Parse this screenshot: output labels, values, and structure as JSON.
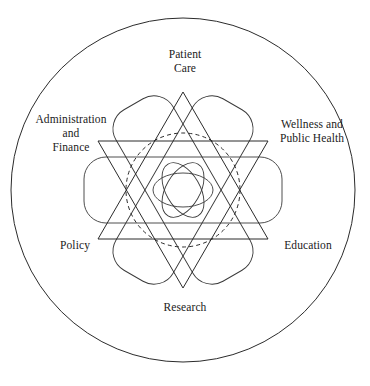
{
  "diagram": {
    "shape_summary": "Large outer circle enclosing a six-petal rosette made of three overlapping rounded capsules, a dashed inner circle, a hexagram of six straight chords, and a central rosette of three overlapping ellipses.",
    "colors": {
      "stroke": "#2b2b2b",
      "stroke_light": "#3a3a3a",
      "background": "#ffffff",
      "text": "#1a1a1a"
    },
    "labels": [
      {
        "id": "patient-care",
        "text": "Patient\nCare",
        "position": "top"
      },
      {
        "id": "wellness",
        "text": "Wellness and\nPublic Health",
        "position": "upper-right"
      },
      {
        "id": "education",
        "text": "Education",
        "position": "lower-right"
      },
      {
        "id": "research",
        "text": "Research",
        "position": "bottom"
      },
      {
        "id": "policy",
        "text": "Policy",
        "position": "lower-left"
      },
      {
        "id": "administration",
        "text": "Administration\nand\nFinance",
        "position": "upper-left"
      }
    ],
    "geometry": {
      "center_x": 183,
      "center_y": 190,
      "outer_circle_radius": 177,
      "dashed_circle_radius": 57,
      "capsule_half_length": 99,
      "capsule_half_width": 33,
      "capsule_corner_radius": 22,
      "capsule_angles_deg": [
        0,
        60,
        120
      ],
      "hexagram_circumradius": 98,
      "center_ellipse_rx": 28,
      "center_ellipse_ry": 16,
      "center_ellipse_angles_deg": [
        0,
        60,
        120
      ]
    }
  }
}
